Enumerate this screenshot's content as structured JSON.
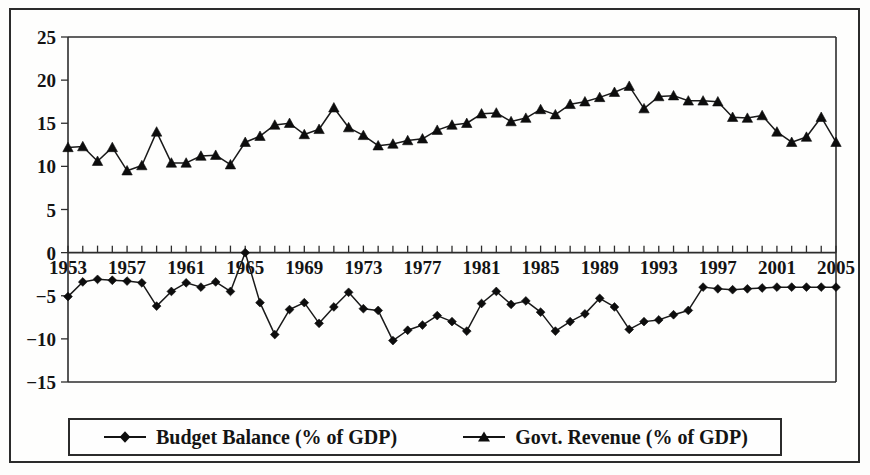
{
  "chart_data": {
    "type": "line",
    "title": "",
    "subtitle": "",
    "xlabel": "",
    "ylabel": "",
    "xlim": [
      1953,
      2005
    ],
    "ylim": [
      -15,
      25
    ],
    "ytick_step": 5,
    "xtick_step": 4,
    "grid": false,
    "legend_position": "bottom",
    "yticks": [
      "25",
      "20",
      "15",
      "10",
      "5",
      "0",
      "-5",
      "-10",
      "-15"
    ],
    "ytick_values": [
      25,
      20,
      15,
      10,
      5,
      0,
      -5,
      -10,
      -15
    ],
    "xticks": [
      "1953",
      "1957",
      "1961",
      "1965",
      "1969",
      "1973",
      "1977",
      "1981",
      "1985",
      "1989",
      "1993",
      "1997",
      "2001",
      "2005"
    ],
    "xtick_values": [
      1953,
      1957,
      1961,
      1965,
      1969,
      1973,
      1977,
      1981,
      1985,
      1989,
      1993,
      1997,
      2001,
      2005
    ],
    "x": [
      1953,
      1954,
      1955,
      1956,
      1957,
      1958,
      1959,
      1960,
      1961,
      1962,
      1963,
      1964,
      1965,
      1966,
      1967,
      1968,
      1969,
      1970,
      1971,
      1972,
      1973,
      1974,
      1975,
      1976,
      1977,
      1978,
      1979,
      1980,
      1981,
      1982,
      1983,
      1984,
      1985,
      1986,
      1987,
      1988,
      1989,
      1990,
      1991,
      1992,
      1993,
      1994,
      1995,
      1996,
      1997,
      1998,
      1999,
      2000,
      2001,
      2002,
      2003,
      2004,
      2005
    ],
    "series": [
      {
        "name": "Budget Balance (% of GDP)",
        "marker": "diamond",
        "color": "#0d0d0d",
        "values": [
          -5.1,
          -3.4,
          -3.1,
          -3.2,
          -3.3,
          -3.5,
          -6.2,
          -4.5,
          -3.5,
          -4.0,
          -3.4,
          -4.5,
          0.0,
          -5.8,
          -9.5,
          -6.6,
          -5.8,
          -8.2,
          -6.3,
          -4.6,
          -6.5,
          -6.7,
          -10.2,
          -9.0,
          -8.4,
          -7.3,
          -8.0,
          -9.1,
          -5.9,
          -4.5,
          -6.0,
          -5.6,
          -6.9,
          -9.1,
          -8.0,
          -7.1,
          -5.3,
          -6.3,
          -8.9,
          -8.0,
          -7.8,
          -7.2,
          -6.7,
          -4.0,
          -4.2,
          -4.3,
          -4.2,
          -4.1,
          -4.0,
          -4.0,
          -4.0,
          -4.0,
          -4.0
        ]
      },
      {
        "name": "Govt. Revenue (% of GDP)",
        "marker": "triangle",
        "color": "#0d0d0d",
        "values": [
          12.2,
          12.3,
          10.6,
          12.2,
          9.5,
          10.1,
          14.0,
          10.4,
          10.4,
          11.2,
          11.3,
          10.2,
          12.8,
          13.5,
          14.8,
          15.0,
          13.7,
          14.3,
          16.8,
          14.5,
          13.6,
          12.4,
          12.6,
          13.0,
          13.2,
          14.2,
          14.8,
          15.0,
          16.1,
          16.2,
          15.2,
          15.6,
          16.6,
          16.0,
          17.2,
          17.5,
          18.0,
          18.6,
          19.3,
          16.7,
          18.1,
          18.2,
          17.6,
          17.6,
          17.5,
          15.7,
          15.6,
          15.9,
          14.0,
          12.8,
          13.4,
          15.7,
          12.8
        ]
      }
    ],
    "legend": [
      {
        "label": "Budget Balance (% of GDP)",
        "marker": "diamond"
      },
      {
        "label": "Govt. Revenue (% of GDP)",
        "marker": "triangle"
      }
    ]
  }
}
